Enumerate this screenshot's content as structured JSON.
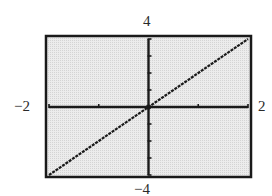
{
  "chart_data": {
    "type": "line",
    "title": "",
    "xlabel": "",
    "ylabel": "",
    "xlim": [
      -2,
      2
    ],
    "ylim": [
      -4,
      4
    ],
    "x_ticks": [
      -2,
      -1,
      0,
      1,
      2
    ],
    "y_ticks": [
      -4,
      -3,
      -2,
      -1,
      0,
      1,
      2,
      3,
      4
    ],
    "grid": false,
    "legend": null,
    "series": [
      {
        "name": "y = 2x",
        "x": [
          -2,
          -1,
          0,
          1,
          2
        ],
        "y": [
          -4,
          -2,
          0,
          2,
          4
        ]
      }
    ],
    "window_labels": {
      "xmin": "−2",
      "xmax": "2",
      "ymin": "−4",
      "ymax": "4"
    },
    "colors": {
      "background": "#e6e6e6",
      "frame": "#1a1a1a",
      "axes": "#1a1a1a",
      "line": "#1a1a1a"
    }
  }
}
